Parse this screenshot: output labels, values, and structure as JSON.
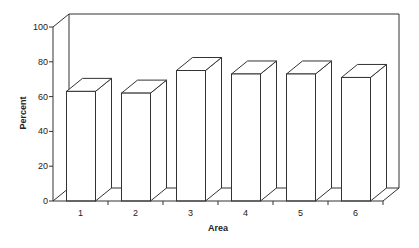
{
  "chart_data": {
    "type": "bar",
    "style": "3d-column",
    "title": "",
    "xlabel": "Area",
    "ylabel": "Percent",
    "categories": [
      "1",
      "2",
      "3",
      "4",
      "5",
      "6"
    ],
    "values": [
      63,
      62,
      75,
      73,
      73,
      71
    ],
    "ylim": [
      0,
      100
    ],
    "yticks": [
      0,
      20,
      40,
      60,
      80,
      100
    ],
    "grid": false,
    "legend": null,
    "colors": {
      "bar_fill": "#ffffff",
      "line": "#333333",
      "background": "#ffffff"
    }
  }
}
